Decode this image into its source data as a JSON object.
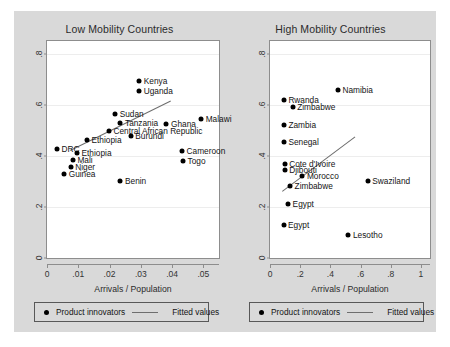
{
  "chart_data": [
    {
      "type": "scatter",
      "title": "Low Mobility Countries",
      "xlabel": "Arrivals / Population",
      "ylabel": "",
      "xlim": [
        0,
        0.055
      ],
      "ylim": [
        0,
        0.85
      ],
      "xticks": [
        "0",
        ".01",
        ".02",
        ".03",
        ".04",
        ".05"
      ],
      "xtickvals": [
        0,
        0.01,
        0.02,
        0.03,
        0.04,
        0.05
      ],
      "yticks": [
        "0",
        ".2",
        ".4",
        ".6",
        ".8"
      ],
      "ytickvals": [
        0,
        0.2,
        0.4,
        0.6,
        0.8
      ],
      "grid": true,
      "legend": {
        "position": "below",
        "marker_label": "Product innovators",
        "line_label": "Fitted values"
      },
      "points": [
        {
          "label": "Kenya",
          "x": 0.0295,
          "y": 0.695,
          "side": "right"
        },
        {
          "label": "Uganda",
          "x": 0.0295,
          "y": 0.655,
          "side": "right"
        },
        {
          "label": "Sudan",
          "x": 0.0218,
          "y": 0.565,
          "side": "right"
        },
        {
          "label": "Tanzania",
          "x": 0.0235,
          "y": 0.53,
          "side": "right"
        },
        {
          "label": "Ghana",
          "x": 0.0382,
          "y": 0.525,
          "side": "right"
        },
        {
          "label": "Malawi",
          "x": 0.0493,
          "y": 0.545,
          "side": "right"
        },
        {
          "label": "Central African Republic",
          "x": 0.0198,
          "y": 0.497,
          "side": "right"
        },
        {
          "label": "Burundi",
          "x": 0.0268,
          "y": 0.478,
          "side": "right"
        },
        {
          "label": "Ethiopia",
          "x": 0.0128,
          "y": 0.462,
          "side": "right"
        },
        {
          "label": "DRC",
          "x": 0.0032,
          "y": 0.428,
          "side": "right"
        },
        {
          "label": "Ethiopia",
          "x": 0.0096,
          "y": 0.413,
          "side": "right"
        },
        {
          "label": "Mali",
          "x": 0.0083,
          "y": 0.385,
          "side": "right"
        },
        {
          "label": "Niger",
          "x": 0.0076,
          "y": 0.357,
          "side": "right"
        },
        {
          "label": "Guinea",
          "x": 0.0055,
          "y": 0.33,
          "side": "right"
        },
        {
          "label": "Cameroon",
          "x": 0.0432,
          "y": 0.418,
          "side": "right"
        },
        {
          "label": "Togo",
          "x": 0.0435,
          "y": 0.378,
          "side": "right"
        },
        {
          "label": "Benin",
          "x": 0.0235,
          "y": 0.3,
          "side": "right"
        }
      ],
      "fit_line": {
        "x0": 0.0073,
        "y0": 0.425,
        "x1": 0.0393,
        "y1": 0.618
      }
    },
    {
      "type": "scatter",
      "title": "High Mobility Countries",
      "xlabel": "Arrivals / Population",
      "ylabel": "",
      "xlim": [
        0,
        1.06
      ],
      "ylim": [
        0,
        0.85
      ],
      "xticks": [
        "0",
        ".2",
        ".4",
        ".6",
        ".8",
        "1"
      ],
      "xtickvals": [
        0,
        0.2,
        0.4,
        0.6,
        0.8,
        1
      ],
      "yticks": [
        "0",
        ".2",
        ".4",
        ".6",
        ".8"
      ],
      "ytickvals": [
        0,
        0.2,
        0.4,
        0.6,
        0.8
      ],
      "grid": true,
      "legend": {
        "position": "below",
        "marker_label": "Product innovators",
        "line_label": "Fitted values"
      },
      "points": [
        {
          "label": "Namibia",
          "x": 0.45,
          "y": 0.66,
          "side": "right"
        },
        {
          "label": "Rwanda",
          "x": 0.092,
          "y": 0.62,
          "side": "right"
        },
        {
          "label": "Zimbabwe",
          "x": 0.15,
          "y": 0.592,
          "side": "right"
        },
        {
          "label": "Zambia",
          "x": 0.092,
          "y": 0.52,
          "side": "right"
        },
        {
          "label": "Senegal",
          "x": 0.092,
          "y": 0.455,
          "side": "right"
        },
        {
          "label": "Cote d'Ivoire",
          "x": 0.097,
          "y": 0.367,
          "side": "right"
        },
        {
          "label": "Djibouti",
          "x": 0.097,
          "y": 0.345,
          "side": "right"
        },
        {
          "label": "Morocco",
          "x": 0.215,
          "y": 0.32,
          "side": "right"
        },
        {
          "label": "Swaziland",
          "x": 0.648,
          "y": 0.3,
          "side": "right"
        },
        {
          "label": "Zimbabwe",
          "x": 0.133,
          "y": 0.283,
          "side": "right"
        },
        {
          "label": "Egypt",
          "x": 0.12,
          "y": 0.212,
          "side": "right"
        },
        {
          "label": "Egypt",
          "x": 0.09,
          "y": 0.13,
          "side": "right"
        },
        {
          "label": "Lesotho",
          "x": 0.52,
          "y": 0.09,
          "side": "right"
        }
      ],
      "fit_line": {
        "x0": 0.08,
        "y0": 0.262,
        "x1": 0.56,
        "y1": 0.475
      }
    }
  ]
}
